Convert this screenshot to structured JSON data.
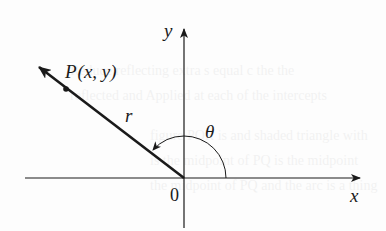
{
  "figure": {
    "colors": {
      "ink": "#1a1a1a",
      "background": "#fdfdfd"
    },
    "labels": {
      "x_axis": "x",
      "y_axis": "y",
      "origin": "0",
      "point": "P(x, y)",
      "point_name": "P",
      "point_coords": "(x, y)",
      "radius": "r",
      "angle": "θ"
    },
    "geometry": {
      "origin": [
        184,
        178
      ],
      "x_axis": {
        "from": [
          25,
          178
        ],
        "to": [
          362,
          178
        ]
      },
      "y_axis": {
        "from": [
          184,
          228
        ],
        "to": [
          184,
          27
        ]
      },
      "vector": {
        "from": [
          184,
          178
        ],
        "to": [
          37,
          65
        ]
      },
      "point_marker": [
        66,
        89
      ],
      "angle_arc": {
        "radius": 42,
        "start_deg": 0,
        "end_deg": 142
      }
    }
  }
}
